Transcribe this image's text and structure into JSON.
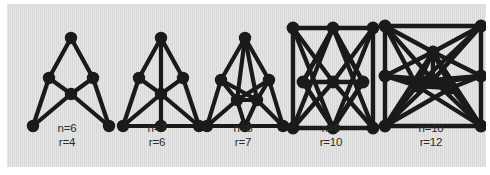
{
  "figure": {
    "name": "graph-family-figure",
    "background_color": "#ffffff",
    "panel_color": "#d9d9d9",
    "ink_color": "#1a1a1a",
    "label_color": "#2b2b2b"
  },
  "graphs": [
    {
      "id": "graph-1",
      "n_label": "n=6",
      "r_label": "r=4",
      "n": 6,
      "r": 4,
      "viewbox": "0 0 96 112",
      "vertices": [
        {
          "id": "a",
          "x": 48,
          "y": 12
        },
        {
          "id": "b",
          "x": 26,
          "y": 52
        },
        {
          "id": "c",
          "x": 70,
          "y": 52
        },
        {
          "id": "d",
          "x": 48,
          "y": 68
        },
        {
          "id": "e",
          "x": 10,
          "y": 100
        },
        {
          "id": "f",
          "x": 86,
          "y": 100
        }
      ],
      "edges": [
        [
          "a",
          "b"
        ],
        [
          "a",
          "c"
        ],
        [
          "b",
          "d"
        ],
        [
          "c",
          "d"
        ],
        [
          "b",
          "e"
        ],
        [
          "c",
          "f"
        ],
        [
          "d",
          "e"
        ],
        [
          "d",
          "f"
        ]
      ],
      "vertex_radius": 6.2,
      "edge_width": 4.2
    },
    {
      "id": "graph-2",
      "n_label": "n=7",
      "r_label": "r=6",
      "n": 7,
      "r": 6,
      "viewbox": "0 0 96 112",
      "vertices": [
        {
          "id": "a",
          "x": 48,
          "y": 12
        },
        {
          "id": "b",
          "x": 26,
          "y": 52
        },
        {
          "id": "c",
          "x": 70,
          "y": 52
        },
        {
          "id": "d",
          "x": 48,
          "y": 68
        },
        {
          "id": "e",
          "x": 10,
          "y": 100
        },
        {
          "id": "f",
          "x": 86,
          "y": 100
        },
        {
          "id": "g",
          "x": 48,
          "y": 100
        }
      ],
      "edges": [
        [
          "a",
          "b"
        ],
        [
          "a",
          "c"
        ],
        [
          "a",
          "d"
        ],
        [
          "b",
          "d"
        ],
        [
          "c",
          "d"
        ],
        [
          "b",
          "e"
        ],
        [
          "c",
          "f"
        ],
        [
          "d",
          "e"
        ],
        [
          "d",
          "f"
        ],
        [
          "d",
          "g"
        ],
        [
          "e",
          "g"
        ],
        [
          "f",
          "g"
        ],
        [
          "e",
          "f"
        ]
      ],
      "vertex_radius": 6.2,
      "edge_width": 4.2
    },
    {
      "id": "graph-3",
      "n_label": "n=6",
      "r_label": "r=7",
      "n": 6,
      "r": 7,
      "viewbox": "0 0 96 112",
      "vertices": [
        {
          "id": "a",
          "x": 48,
          "y": 12
        },
        {
          "id": "b",
          "x": 24,
          "y": 54
        },
        {
          "id": "c",
          "x": 72,
          "y": 54
        },
        {
          "id": "d",
          "x": 40,
          "y": 74
        },
        {
          "id": "e",
          "x": 60,
          "y": 74
        },
        {
          "id": "f",
          "x": 10,
          "y": 100
        },
        {
          "id": "g",
          "x": 48,
          "y": 100
        },
        {
          "id": "h",
          "x": 86,
          "y": 100
        }
      ],
      "edges": [
        [
          "a",
          "b"
        ],
        [
          "a",
          "c"
        ],
        [
          "a",
          "d"
        ],
        [
          "a",
          "e"
        ],
        [
          "b",
          "d"
        ],
        [
          "b",
          "e"
        ],
        [
          "c",
          "d"
        ],
        [
          "c",
          "e"
        ],
        [
          "d",
          "e"
        ],
        [
          "b",
          "f"
        ],
        [
          "c",
          "h"
        ],
        [
          "d",
          "f"
        ],
        [
          "d",
          "g"
        ],
        [
          "e",
          "g"
        ],
        [
          "e",
          "h"
        ],
        [
          "f",
          "g"
        ],
        [
          "g",
          "h"
        ]
      ],
      "vertex_radius": 6.2,
      "edge_width": 4.2
    },
    {
      "id": "graph-4",
      "n_label": "n=9",
      "r_label": "r=10",
      "n": 9,
      "r": 10,
      "viewbox": "0 0 104 120",
      "vertices": [
        {
          "id": "t1",
          "x": 12,
          "y": 10
        },
        {
          "id": "t2",
          "x": 52,
          "y": 10
        },
        {
          "id": "t3",
          "x": 92,
          "y": 10
        },
        {
          "id": "m1",
          "x": 22,
          "y": 64
        },
        {
          "id": "m2",
          "x": 52,
          "y": 64
        },
        {
          "id": "m3",
          "x": 82,
          "y": 64
        },
        {
          "id": "b1",
          "x": 12,
          "y": 110
        },
        {
          "id": "b2",
          "x": 52,
          "y": 110
        },
        {
          "id": "b3",
          "x": 92,
          "y": 110
        }
      ],
      "edges": [
        [
          "t1",
          "t2"
        ],
        [
          "t2",
          "t3"
        ],
        [
          "b1",
          "b2"
        ],
        [
          "b2",
          "b3"
        ],
        [
          "t1",
          "b1"
        ],
        [
          "t3",
          "b3"
        ],
        [
          "m1",
          "m2"
        ],
        [
          "m2",
          "m3"
        ],
        [
          "t1",
          "m2"
        ],
        [
          "t2",
          "m1"
        ],
        [
          "t2",
          "m3"
        ],
        [
          "t3",
          "m2"
        ],
        [
          "b1",
          "m2"
        ],
        [
          "b2",
          "m1"
        ],
        [
          "b2",
          "m3"
        ],
        [
          "b3",
          "m2"
        ],
        [
          "t1",
          "b2"
        ],
        [
          "t3",
          "b2"
        ],
        [
          "t2",
          "b1"
        ],
        [
          "t2",
          "b3"
        ],
        [
          "m1",
          "b2"
        ],
        [
          "m3",
          "b2"
        ],
        [
          "m1",
          "t2"
        ],
        [
          "m3",
          "t2"
        ]
      ],
      "vertex_radius": 6.4,
      "edge_width": 4.4
    },
    {
      "id": "graph-5",
      "n_label": "n=10",
      "r_label": "r=12",
      "n": 10,
      "r": 12,
      "viewbox": "0 0 116 120",
      "vertices": [
        {
          "id": "l1",
          "x": 10,
          "y": 10
        },
        {
          "id": "l2",
          "x": 10,
          "y": 60
        },
        {
          "id": "l3",
          "x": 10,
          "y": 110
        },
        {
          "id": "r1",
          "x": 106,
          "y": 10
        },
        {
          "id": "r2",
          "x": 106,
          "y": 60
        },
        {
          "id": "r3",
          "x": 106,
          "y": 110
        },
        {
          "id": "c1",
          "x": 58,
          "y": 36
        },
        {
          "id": "c2",
          "x": 42,
          "y": 70
        },
        {
          "id": "c3",
          "x": 58,
          "y": 64
        },
        {
          "id": "c4",
          "x": 76,
          "y": 72
        }
      ],
      "edges": [
        [
          "l1",
          "l2"
        ],
        [
          "l2",
          "l3"
        ],
        [
          "r1",
          "r2"
        ],
        [
          "r2",
          "r3"
        ],
        [
          "l1",
          "c1"
        ],
        [
          "l1",
          "c2"
        ],
        [
          "l1",
          "c3"
        ],
        [
          "l2",
          "c1"
        ],
        [
          "l2",
          "c2"
        ],
        [
          "l2",
          "c3"
        ],
        [
          "l2",
          "c4"
        ],
        [
          "l3",
          "c1"
        ],
        [
          "l3",
          "c2"
        ],
        [
          "l3",
          "c3"
        ],
        [
          "l3",
          "c4"
        ],
        [
          "r1",
          "c1"
        ],
        [
          "r1",
          "c3"
        ],
        [
          "r1",
          "c2"
        ],
        [
          "r2",
          "c1"
        ],
        [
          "r2",
          "c3"
        ],
        [
          "r2",
          "c4"
        ],
        [
          "r2",
          "c2"
        ],
        [
          "r3",
          "c3"
        ],
        [
          "r3",
          "c4"
        ],
        [
          "r3",
          "c1"
        ],
        [
          "r3",
          "c2"
        ],
        [
          "c1",
          "c2"
        ],
        [
          "c1",
          "c3"
        ],
        [
          "c1",
          "c4"
        ],
        [
          "c2",
          "c3"
        ],
        [
          "c3",
          "c4"
        ],
        [
          "c2",
          "c4"
        ],
        [
          "l1",
          "r1"
        ],
        [
          "l3",
          "r3"
        ]
      ],
      "vertex_radius": 6.4,
      "edge_width": 4.4
    }
  ],
  "layout": {
    "cells": [
      {
        "left": 10,
        "width": 100,
        "svg_left": 6,
        "svg_top": 22,
        "svg_w": 96,
        "svg_h": 112,
        "label_top": 118
      },
      {
        "left": 104,
        "width": 92,
        "svg_left": 2,
        "svg_top": 22,
        "svg_w": 96,
        "svg_h": 112,
        "label_top": 118
      },
      {
        "left": 188,
        "width": 96,
        "svg_left": 2,
        "svg_top": 22,
        "svg_w": 96,
        "svg_h": 112,
        "label_top": 118
      },
      {
        "left": 272,
        "width": 104,
        "svg_left": 2,
        "svg_top": 14,
        "svg_w": 104,
        "svg_h": 120,
        "label_top": 118
      },
      {
        "left": 366,
        "width": 116,
        "svg_left": 2,
        "svg_top": 12,
        "svg_w": 116,
        "svg_h": 120,
        "label_top": 118
      }
    ]
  }
}
